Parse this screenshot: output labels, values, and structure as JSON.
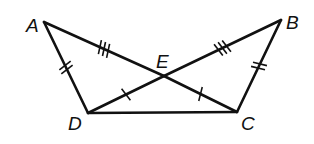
{
  "diagram": {
    "type": "geometry",
    "stroke_color": "#111111",
    "background": "#ffffff",
    "points": {
      "A": {
        "x": 44,
        "y": 22,
        "label": "A",
        "lx": 26,
        "ly": 32
      },
      "B": {
        "x": 281,
        "y": 20,
        "label": "B",
        "lx": 286,
        "ly": 29
      },
      "C": {
        "x": 237,
        "y": 112,
        "label": "C",
        "lx": 241,
        "ly": 130
      },
      "D": {
        "x": 88,
        "y": 113,
        "label": "D",
        "lx": 68,
        "ly": 130
      },
      "E": {
        "x": 164,
        "y": 76,
        "label": "E",
        "lx": 156,
        "ly": 68
      }
    },
    "segments": [
      {
        "name": "AD",
        "from": "A",
        "to": "D",
        "ticks": 2
      },
      {
        "name": "BC",
        "from": "B",
        "to": "C",
        "ticks": 2
      },
      {
        "name": "AE",
        "from": "A",
        "to": "E",
        "ticks": 3
      },
      {
        "name": "BE",
        "from": "B",
        "to": "E",
        "ticks": 3
      },
      {
        "name": "DE",
        "from": "D",
        "to": "E",
        "ticks": 1
      },
      {
        "name": "CE",
        "from": "C",
        "to": "E",
        "ticks": 1
      },
      {
        "name": "DC",
        "from": "D",
        "to": "C",
        "ticks": 0
      }
    ],
    "congruences": [
      "AD ≅ BC",
      "AE ≅ BE",
      "DE ≅ CE"
    ]
  }
}
